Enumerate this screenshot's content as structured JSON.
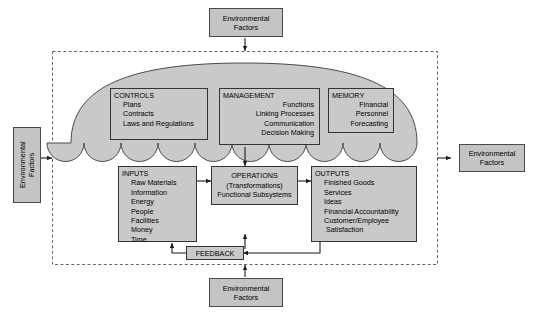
{
  "diagram": {
    "colors": {
      "fill": "#c9c9c9",
      "stroke": "#333333",
      "boundary": "#555555",
      "background": "#ffffff"
    }
  },
  "environmental_factors": {
    "label_line1": "Environmental",
    "label_line2": "Factors",
    "positions": [
      "top",
      "left",
      "right",
      "bottom"
    ]
  },
  "cloud": {
    "name": "organizational-umbrella",
    "boxes": [
      {
        "id": "controls",
        "header": "CONTROLS",
        "items": [
          "Plans",
          "Contracts",
          "Laws and Regulations"
        ]
      },
      {
        "id": "management",
        "header": "MANAGEMENT",
        "items": [
          "Functions",
          "Linking Processes",
          "Communication",
          "Decision Making"
        ]
      },
      {
        "id": "memory",
        "header": "MEMORY",
        "items": [
          "Financial",
          "Personnel",
          "Forecasting"
        ]
      }
    ]
  },
  "flow": {
    "inputs": {
      "header": "INPUTS",
      "items": [
        "Raw Materials",
        "Information",
        "Energy",
        "People",
        "Facilities",
        "Money",
        "Time"
      ]
    },
    "operations": {
      "header": "OPERATIONS",
      "line2": "(Transformations)",
      "line3": "Functional Subsystems"
    },
    "outputs": {
      "header": "OUTPUTS",
      "items": [
        "Finished Goods",
        "Services",
        "Ideas",
        "Financial Accountability",
        "Customer/Employee",
        "Satisfaction"
      ]
    },
    "feedback": {
      "label": "FEEDBACK"
    }
  }
}
